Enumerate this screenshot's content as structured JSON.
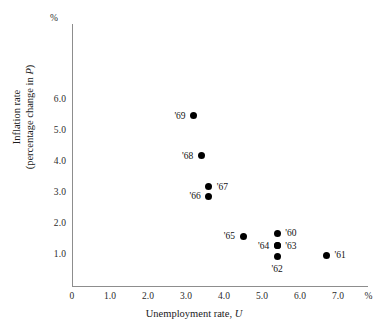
{
  "chart_data": {
    "type": "scatter",
    "title": "",
    "xlabel": "Unemployment rate, U",
    "ylabel": "Inflation rate (percentage change in P)",
    "ylabel_line1": "Inflation rate",
    "ylabel_line2": "(percentage change in P)",
    "x_unit": "%",
    "y_unit": "%",
    "xlim": [
      0,
      7.6
    ],
    "ylim": [
      0,
      6.6
    ],
    "grid": false,
    "legend": "none",
    "x_ticks": [
      "0",
      "1.0",
      "2.0",
      "3.0",
      "4.0",
      "5.0",
      "6.0",
      "7.0"
    ],
    "x_tick_values": [
      0,
      1.0,
      2.0,
      3.0,
      4.0,
      5.0,
      6.0,
      7.0
    ],
    "y_ticks": [
      "1.0",
      "2.0",
      "3.0",
      "4.0",
      "5.0",
      "6.0"
    ],
    "y_tick_values": [
      1.0,
      2.0,
      3.0,
      4.0,
      5.0,
      6.0
    ],
    "point_color": "#000000",
    "axis_color": "#8d8d8d",
    "points": [
      {
        "label": "'69",
        "x": 3.2,
        "y": 5.5,
        "label_pos": "left"
      },
      {
        "label": "'68",
        "x": 3.4,
        "y": 4.2,
        "label_pos": "left"
      },
      {
        "label": "'67",
        "x": 3.6,
        "y": 3.2,
        "label_pos": "right"
      },
      {
        "label": "'66",
        "x": 3.6,
        "y": 2.9,
        "label_pos": "left"
      },
      {
        "label": "'65",
        "x": 4.5,
        "y": 1.6,
        "label_pos": "left"
      },
      {
        "label": "'60",
        "x": 5.4,
        "y": 1.7,
        "label_pos": "right"
      },
      {
        "label": "'64",
        "x": 5.4,
        "y": 1.3,
        "label_pos": "left"
      },
      {
        "label": "'63",
        "x": 5.4,
        "y": 1.3,
        "label_pos": "right"
      },
      {
        "label": "'62",
        "x": 5.4,
        "y": 0.95,
        "label_pos": "below"
      },
      {
        "label": "'61",
        "x": 6.7,
        "y": 1.0,
        "label_pos": "right"
      }
    ]
  }
}
